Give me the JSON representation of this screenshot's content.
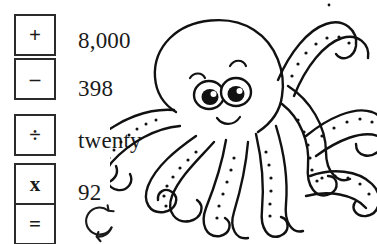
{
  "page": {
    "background_color": "#ffffff",
    "ink_color": "#1a1a1a",
    "width": 377,
    "height": 244
  },
  "operator_keys": [
    {
      "id": "plus",
      "glyph": "+",
      "name": "plus-key"
    },
    {
      "id": "minus",
      "glyph": "–",
      "name": "minus-key"
    },
    {
      "id": "divide",
      "glyph": "÷",
      "name": "divide-key"
    },
    {
      "id": "times",
      "glyph": "x",
      "name": "times-key"
    },
    {
      "id": "equals",
      "glyph": "=",
      "name": "equals-key"
    }
  ],
  "values": [
    {
      "id": "v1",
      "text": "8,000"
    },
    {
      "id": "v2",
      "text": "398"
    },
    {
      "id": "v3",
      "text": "twenty"
    },
    {
      "id": "v4",
      "text": "92"
    }
  ],
  "icons": {
    "rotate": "rotate-arrows-icon",
    "octopus": "octopus-illustration"
  }
}
